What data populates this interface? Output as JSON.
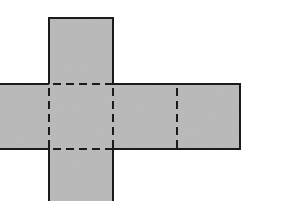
{
  "diagram": {
    "type": "cube-net-fragment",
    "colors": {
      "fill": "#b4b4b4",
      "stroke": "#1a1a1a",
      "background": "#ffffff"
    },
    "faces": [
      {
        "id": "top",
        "x": 49,
        "y": 18,
        "w": 64,
        "h": 66
      },
      {
        "id": "left",
        "x": -2,
        "y": 84,
        "w": 51,
        "h": 65
      },
      {
        "id": "center",
        "x": 49,
        "y": 84,
        "w": 64,
        "h": 65
      },
      {
        "id": "right-1",
        "x": 113,
        "y": 84,
        "w": 64,
        "h": 65
      },
      {
        "id": "right-2",
        "x": 177,
        "y": 84,
        "w": 63,
        "h": 65
      },
      {
        "id": "bottom",
        "x": 49,
        "y": 149,
        "w": 64,
        "h": 56
      }
    ],
    "fold_lines": [
      {
        "x1": 49,
        "y1": 84,
        "x2": 113,
        "y2": 84
      },
      {
        "x1": 49,
        "y1": 149,
        "x2": 113,
        "y2": 149
      },
      {
        "x1": 49,
        "y1": 84,
        "x2": 49,
        "y2": 149
      },
      {
        "x1": 113,
        "y1": 84,
        "x2": 113,
        "y2": 149
      },
      {
        "x1": 177,
        "y1": 84,
        "x2": 177,
        "y2": 149
      }
    ]
  }
}
